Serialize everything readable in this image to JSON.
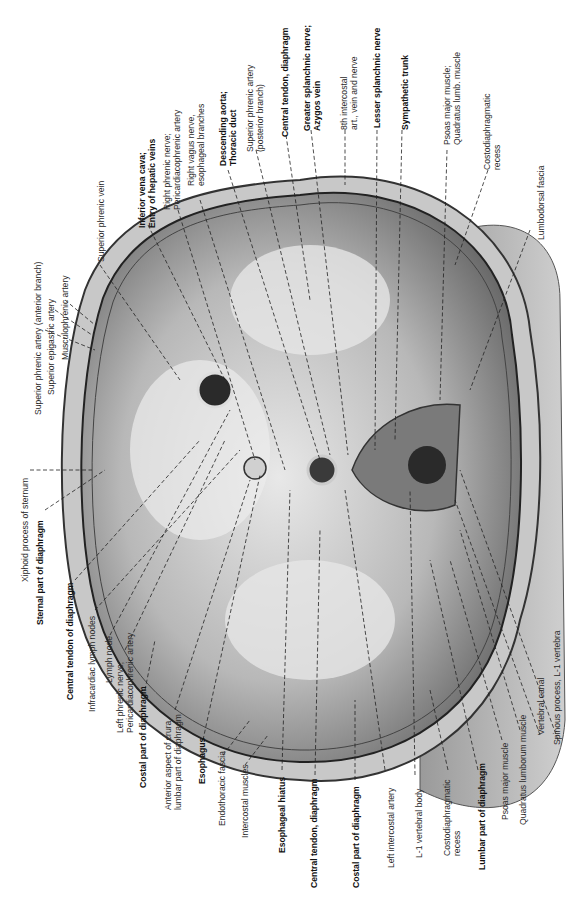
{
  "figure": {
    "orientation": "rotated 90 degrees counter-clockwise",
    "colors": {
      "background": "#ffffff",
      "muscle": "#9a9a9a",
      "tendon": "#d8d8d8",
      "outline": "#2b2b2b",
      "vertebra": "#6e6e6e"
    }
  },
  "labels_top": [
    {
      "id": "superior-phrenic-vein",
      "text": [
        "Superior phrenic vein"
      ],
      "bold": false
    },
    {
      "id": "inferior-vena-cava",
      "text": [
        "Inferior vena cava;",
        "Entry of hepatic veins"
      ],
      "bold": true
    },
    {
      "id": "right-phrenic-nerve",
      "text": [
        "Right phrenic nerve;",
        "Pericardiacophrenic artery"
      ],
      "bold": false
    },
    {
      "id": "right-vagus-nerve",
      "text": [
        "Right vagus nerve,",
        "esophageal branches"
      ],
      "bold": false
    },
    {
      "id": "descending-aorta",
      "text": [
        "Descending aorta;",
        "Thoracic duct"
      ],
      "bold": true
    },
    {
      "id": "superior-phrenic-artery-posterior",
      "text": [
        "Superior phrenic artery",
        "(posterior branch)"
      ],
      "bold": false
    },
    {
      "id": "central-tendon-top",
      "text": [
        "Central tendon, diaphragm"
      ],
      "bold": true
    },
    {
      "id": "greater-splanchnic-nerve",
      "text": [
        "Greater splanchnic nerve;",
        "Azygos vein"
      ],
      "bold": true
    },
    {
      "id": "8th-intercostal",
      "text": [
        "8th intercostal",
        "art., vein and nerve"
      ],
      "bold": false
    },
    {
      "id": "lesser-splanchnic-nerve",
      "text": [
        "Lesser splanchnic nerve"
      ],
      "bold": true
    },
    {
      "id": "sympathetic-trunk",
      "text": [
        "Sympathetic trunk"
      ],
      "bold": true
    },
    {
      "id": "psoas-quadratus-top",
      "text": [
        "Psoas major muscle;",
        "Quadratus lumb. muscle"
      ],
      "bold": false
    },
    {
      "id": "costodiaphragmatic-recess-top",
      "text": [
        "Costodiaphragmatic",
        "recess"
      ],
      "bold": false
    },
    {
      "id": "lumbodorsal-fascia",
      "text": [
        "Lumbodorsal fascia"
      ],
      "bold": false
    }
  ],
  "labels_left": [
    {
      "id": "superior-phrenic-artery-anterior",
      "text": [
        "Superior phrenic artery (anterior branch)"
      ],
      "bold": false
    },
    {
      "id": "superior-epigastric-artery",
      "text": [
        "Superior epigastric artery"
      ],
      "bold": false
    },
    {
      "id": "musculophrenic-artery",
      "text": [
        "Musculophrenic artery"
      ],
      "bold": false
    },
    {
      "id": "xiphoid-process",
      "text": [
        "Xiphoid process of sternum"
      ],
      "bold": false
    },
    {
      "id": "sternal-part",
      "text": [
        "Sternal part of diaphragm"
      ],
      "bold": true
    }
  ],
  "labels_bottom": [
    {
      "id": "central-tendon-of-diaphragm",
      "text": [
        "Central tendon of diaphragm"
      ],
      "bold": true
    },
    {
      "id": "infracardiac-lymph-nodes",
      "text": [
        "Infracardiac lymph nodes"
      ],
      "bold": false
    },
    {
      "id": "lymph-node",
      "text": [
        "Lymph node"
      ],
      "bold": false
    },
    {
      "id": "left-phrenic-nerve",
      "text": [
        "Left phrenic nerve;",
        "Pericardiacophrenic artery"
      ],
      "bold": false
    },
    {
      "id": "costal-part-1",
      "text": [
        "Costal part of diaphragm"
      ],
      "bold": true
    },
    {
      "id": "anterior-aspect-crura",
      "text": [
        "Anterior aspect of crura,",
        "lumbar part of diaphragm"
      ],
      "bold": false
    },
    {
      "id": "esophagus",
      "text": [
        "Esophagus"
      ],
      "bold": true
    },
    {
      "id": "endothoracic-fascia",
      "text": [
        "Endothoracic fascia"
      ],
      "bold": false
    },
    {
      "id": "intercostal-muscles",
      "text": [
        "Intercostal muscles"
      ],
      "bold": false
    },
    {
      "id": "esophageal-hiatus",
      "text": [
        "Esophageal hiatus"
      ],
      "bold": true
    },
    {
      "id": "central-tendon-bottom",
      "text": [
        "Central tendon, diaphragm"
      ],
      "bold": true
    },
    {
      "id": "costal-part-2",
      "text": [
        "Costal part of diaphragm"
      ],
      "bold": true
    },
    {
      "id": "left-intercostal-artery",
      "text": [
        "Left intercostal artery"
      ],
      "bold": false
    },
    {
      "id": "l1-vertebral-body",
      "text": [
        "L-1 vertebral body"
      ],
      "bold": false
    },
    {
      "id": "costodiaphragmatic-recess-bottom",
      "text": [
        "Costodiaphragmatic",
        "recess"
      ],
      "bold": false
    },
    {
      "id": "lumbar-part",
      "text": [
        "Lumbar part of diaphragm"
      ],
      "bold": true
    },
    {
      "id": "psoas-major",
      "text": [
        "Psoas major muscle"
      ],
      "bold": false
    },
    {
      "id": "quadratus-lumborum",
      "text": [
        "Quadratus lumborum muscle"
      ],
      "bold": false
    },
    {
      "id": "vertebral-canal",
      "text": [
        "Vertebral canal"
      ],
      "bold": false
    },
    {
      "id": "spinous-process",
      "text": [
        "Spinous process, L-1 vertebra"
      ],
      "bold": false
    }
  ],
  "rib_numbers": [
    "5",
    "6",
    "6",
    "7",
    "6",
    "7",
    "6",
    "6",
    "7",
    "8",
    "8",
    "9",
    "9",
    "10",
    "10",
    "11",
    "11",
    "12",
    "12"
  ]
}
